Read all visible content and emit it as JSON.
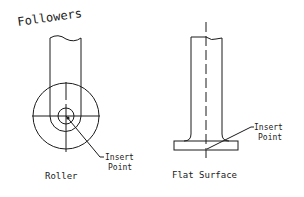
{
  "title": "Followers",
  "figures": [
    {
      "name": "roller",
      "label": "Roller",
      "callout": {
        "line1": "Insert",
        "line2": "Point"
      }
    },
    {
      "name": "flat-surface",
      "label": "Flat Surface",
      "callout": {
        "line1": "Insert",
        "line2": "Point"
      }
    }
  ],
  "colors": {
    "line": "#1a1a1a",
    "background": "#ffffff"
  }
}
